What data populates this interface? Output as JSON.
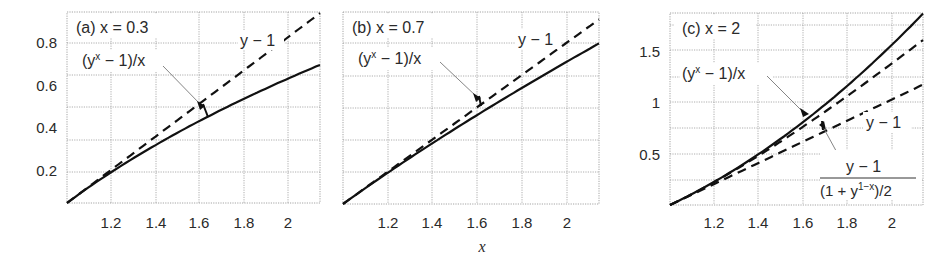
{
  "figure": {
    "xlabel": "x"
  },
  "chart_data": [
    {
      "type": "line",
      "panel": "a",
      "title": "(a) x = 0.3",
      "title_parts": {
        "prefix": "(a) ",
        "var": "x",
        "rest": " = 0.3"
      },
      "xlabel": "",
      "ylabel": "",
      "xticks": [
        "1.2",
        "1.4",
        "1.6",
        "1.8",
        "2"
      ],
      "yticks": [
        "0.2",
        "0.4",
        "0.6",
        "0.8"
      ],
      "grid": true,
      "series": [
        {
          "name": "y − 1",
          "style": "dashed",
          "x": [
            1.0,
            1.2,
            1.4,
            1.6,
            1.8,
            2.0,
            2.2
          ],
          "values": [
            0.0,
            0.2,
            0.4,
            0.6,
            0.8,
            1.0,
            1.2
          ]
        },
        {
          "name": "(y^x − 1)/x",
          "style": "solid",
          "x": [
            1.0,
            1.2,
            1.4,
            1.6,
            1.8,
            2.0,
            2.2
          ],
          "values": [
            0.0,
            0.186,
            0.352,
            0.503,
            0.641,
            0.77,
            0.89
          ]
        }
      ],
      "annotations": [
        {
          "text": "y − 1",
          "target": "dashed"
        },
        {
          "text": "(y^x − 1)/x",
          "target": "solid",
          "arrow": true
        }
      ]
    },
    {
      "type": "line",
      "panel": "b",
      "title": "(b) x = 0.7",
      "title_parts": {
        "prefix": "(b) ",
        "var": "x",
        "rest": " = 0.7"
      },
      "xlabel": "x",
      "ylabel": "",
      "xticks": [
        "1.2",
        "1.4",
        "1.6",
        "1.8",
        "2"
      ],
      "yticks": [],
      "grid": true,
      "series": [
        {
          "name": "y − 1",
          "style": "dashed",
          "x": [
            1.0,
            1.2,
            1.4,
            1.6,
            1.8,
            2.0,
            2.2
          ],
          "values": [
            0.0,
            0.2,
            0.4,
            0.6,
            0.8,
            1.0,
            1.2
          ]
        },
        {
          "name": "(y^x − 1)/x",
          "style": "solid",
          "x": [
            1.0,
            1.2,
            1.4,
            1.6,
            1.8,
            2.0,
            2.2
          ],
          "values": [
            0.0,
            0.194,
            0.378,
            0.556,
            0.725,
            0.889,
            1.048
          ]
        }
      ],
      "annotations": [
        {
          "text": "y − 1",
          "target": "dashed"
        },
        {
          "text": "(y^x − 1)/x",
          "target": "solid",
          "arrow": true
        }
      ]
    },
    {
      "type": "line",
      "panel": "c",
      "title": "(c) x = 2",
      "title_parts": {
        "prefix": "(c) ",
        "var": "x",
        "rest": " = 2"
      },
      "xlabel": "",
      "ylabel": "",
      "xticks": [
        "1.2",
        "1.4",
        "1.6",
        "1.8",
        "2"
      ],
      "yticks": [
        "0.5",
        "1",
        "1.5"
      ],
      "grid": true,
      "series": [
        {
          "name": "(y^x − 1)/x",
          "style": "solid",
          "x": [
            1.0,
            1.2,
            1.4,
            1.6,
            1.8,
            2.0,
            2.2
          ],
          "values": [
            0.0,
            0.22,
            0.48,
            0.78,
            1.12,
            1.5,
            1.92
          ]
        },
        {
          "name": "(y − 1)/((1 + y^(1−x))/2)",
          "style": "dashed",
          "x": [
            1.0,
            1.2,
            1.4,
            1.6,
            1.8,
            2.0,
            2.2
          ],
          "values": [
            0.0,
            0.218,
            0.467,
            0.738,
            1.029,
            1.333,
            1.65
          ]
        },
        {
          "name": "y − 1",
          "style": "dashed",
          "x": [
            1.0,
            1.2,
            1.4,
            1.6,
            1.8,
            2.0,
            2.2
          ],
          "values": [
            0.0,
            0.2,
            0.4,
            0.6,
            0.8,
            1.0,
            1.2
          ]
        }
      ],
      "annotations": [
        {
          "text": "(y^x − 1)/x",
          "target": "solid",
          "arrow": true
        },
        {
          "text": "y − 1",
          "target": "lower dashed"
        },
        {
          "text": "(y − 1) / ((1 + y^(1−x))/2)",
          "target": "upper dashed",
          "arrow": true
        }
      ]
    }
  ],
  "labels": {
    "a_title_prefix": "(a) ",
    "a_title_var": "x",
    "a_title_rest": " = 0.3",
    "b_title_prefix": "(b) ",
    "b_title_var": "x",
    "b_title_rest": " = 0.7",
    "c_title_prefix": "(c) ",
    "c_title_var": "x",
    "c_title_rest": " = 2",
    "ym1_var": "y",
    "ym1_rest": " − 1",
    "pow_open": "(",
    "pow_base": "y",
    "pow_exp": "x",
    "pow_rest": " − 1)/",
    "pow_div": "x",
    "frac_num_var": "y",
    "frac_num_rest": " − 1",
    "frac_den_open": "(1 + ",
    "frac_den_var": "y",
    "frac_den_exp_1": "1−",
    "frac_den_exp_x": "x",
    "frac_den_close": ")/2"
  }
}
